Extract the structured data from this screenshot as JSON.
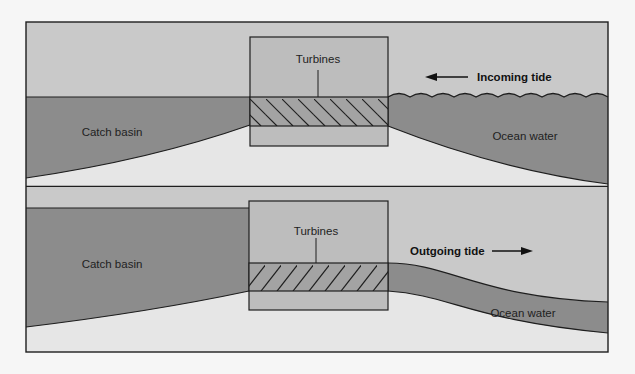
{
  "diagram": {
    "colors": {
      "background": "#f6f6f6",
      "sky": "#c9c9c9",
      "water": "#8c8c8c",
      "ground": "#e6e6e6",
      "dam": "#bdbdbd",
      "turbine_band": "#a3a3a3",
      "line": "#1e1e1e"
    },
    "panels": [
      {
        "id": "incoming",
        "labels": {
          "catch_basin": "Catch basin",
          "turbines": "Turbines",
          "ocean_water": "Ocean water",
          "tide": "Incoming tide"
        },
        "arrow_direction": "left"
      },
      {
        "id": "outgoing",
        "labels": {
          "catch_basin": "Catch basin",
          "turbines": "Turbines",
          "ocean_water": "Ocean water",
          "tide": "Outgoing tide"
        },
        "arrow_direction": "right"
      }
    ]
  }
}
